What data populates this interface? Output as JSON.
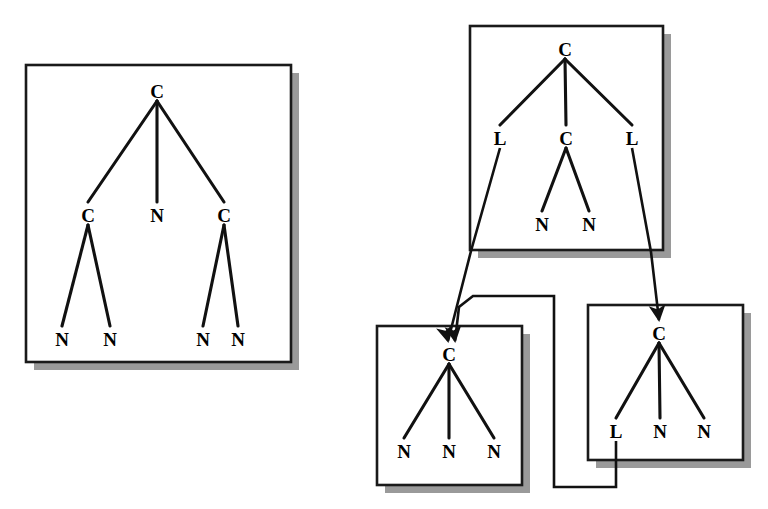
{
  "figure": {
    "kind": "term-graph-diagram",
    "background_color": "#ffffff",
    "ink_color": "#111111",
    "shadow_color": "#9a9a9a",
    "panel_border_color": "#1a1a1a"
  },
  "panels": [
    {
      "id": "panel-left",
      "name": "left-tree-panel",
      "box": {
        "x": 26,
        "y": 65,
        "w": 265,
        "h": 297
      },
      "shadow_offset": 8,
      "nodes": [
        {
          "id": "L0",
          "label": "C",
          "x": 157,
          "y": 92
        },
        {
          "id": "L1",
          "label": "C",
          "x": 88,
          "y": 216
        },
        {
          "id": "L2",
          "label": "N",
          "x": 157,
          "y": 216
        },
        {
          "id": "L3",
          "label": "C",
          "x": 224,
          "y": 216
        },
        {
          "id": "L4",
          "label": "N",
          "x": 62,
          "y": 340
        },
        {
          "id": "L5",
          "label": "N",
          "x": 110,
          "y": 340
        },
        {
          "id": "L6",
          "label": "N",
          "x": 203,
          "y": 340
        },
        {
          "id": "L7",
          "label": "N",
          "x": 238,
          "y": 340
        }
      ],
      "edges": [
        {
          "from": "L0",
          "to": "L1"
        },
        {
          "from": "L0",
          "to": "L2"
        },
        {
          "from": "L0",
          "to": "L3"
        },
        {
          "from": "L1",
          "to": "L4"
        },
        {
          "from": "L1",
          "to": "L5"
        },
        {
          "from": "L3",
          "to": "L6"
        },
        {
          "from": "L3",
          "to": "L7"
        }
      ]
    },
    {
      "id": "panel-top-right",
      "name": "top-right-tree-panel",
      "box": {
        "x": 470,
        "y": 26,
        "w": 193,
        "h": 224
      },
      "shadow_offset": 8,
      "nodes": [
        {
          "id": "T0",
          "label": "C",
          "x": 565,
          "y": 50
        },
        {
          "id": "T1",
          "label": "L",
          "x": 500,
          "y": 139
        },
        {
          "id": "T2",
          "label": "C",
          "x": 566,
          "y": 139
        },
        {
          "id": "T3",
          "label": "L",
          "x": 632,
          "y": 139
        },
        {
          "id": "T4",
          "label": "N",
          "x": 542,
          "y": 225
        },
        {
          "id": "T5",
          "label": "N",
          "x": 589,
          "y": 225
        }
      ],
      "edges": [
        {
          "from": "T0",
          "to": "T1"
        },
        {
          "from": "T0",
          "to": "T2"
        },
        {
          "from": "T0",
          "to": "T3"
        },
        {
          "from": "T2",
          "to": "T4"
        },
        {
          "from": "T2",
          "to": "T5"
        }
      ]
    },
    {
      "id": "panel-bottom-left",
      "name": "bottom-left-tree-panel",
      "box": {
        "x": 377,
        "y": 326,
        "w": 145,
        "h": 159
      },
      "shadow_offset": 8,
      "nodes": [
        {
          "id": "B0",
          "label": "C",
          "x": 449,
          "y": 355
        },
        {
          "id": "B1",
          "label": "N",
          "x": 404,
          "y": 452
        },
        {
          "id": "B2",
          "label": "N",
          "x": 449,
          "y": 452
        },
        {
          "id": "B3",
          "label": "N",
          "x": 494,
          "y": 452
        }
      ],
      "edges": [
        {
          "from": "B0",
          "to": "B1"
        },
        {
          "from": "B0",
          "to": "B2"
        },
        {
          "from": "B0",
          "to": "B3"
        }
      ]
    },
    {
      "id": "panel-bottom-right",
      "name": "bottom-right-tree-panel",
      "box": {
        "x": 588,
        "y": 305,
        "w": 155,
        "h": 155
      },
      "shadow_offset": 8,
      "nodes": [
        {
          "id": "R0",
          "label": "C",
          "x": 659,
          "y": 334
        },
        {
          "id": "R1",
          "label": "L",
          "x": 616,
          "y": 432
        },
        {
          "id": "R2",
          "label": "N",
          "x": 660,
          "y": 432
        },
        {
          "id": "R3",
          "label": "N",
          "x": 704,
          "y": 432
        }
      ],
      "edges": [
        {
          "from": "R0",
          "to": "R1"
        },
        {
          "from": "R0",
          "to": "R2"
        },
        {
          "from": "R0",
          "to": "R3"
        }
      ]
    }
  ],
  "references": [
    {
      "id": "ref-left-L-to-bottom-left",
      "name": "reference-arrow-topright-L-left-to-bottom-left-panel",
      "from_node": "T1",
      "to_panel": "panel-bottom-left",
      "path": "M 500 148 L 471 251 L 448 341",
      "arrow_at": {
        "x": 448,
        "y": 341,
        "angle": 76
      }
    },
    {
      "id": "ref-right-L-to-bottom-right",
      "name": "reference-arrow-topright-L-right-to-bottom-right-panel",
      "from_node": "T3",
      "to_panel": "panel-bottom-right",
      "path": "M 632 148 L 651 252 L 659 320",
      "arrow_at": {
        "x": 659,
        "y": 320,
        "angle": 83
      }
    },
    {
      "id": "ref-bottomright-L-to-bottom-left",
      "name": "reference-arrow-bottomright-L-to-bottom-left-panel",
      "from_node": "R1",
      "to_panel": "panel-bottom-left",
      "path": "M 616 441 L 616 487 L 554 487 L 554 296 L 473 296 L 459 307 L 455 341",
      "arrow_at": {
        "x": 455,
        "y": 341,
        "angle": 82
      }
    }
  ],
  "legend": {
    "node_kinds": [
      {
        "symbol": "C",
        "meaning": "C"
      },
      {
        "symbol": "N",
        "meaning": "N"
      },
      {
        "symbol": "L",
        "meaning": "L"
      }
    ]
  }
}
